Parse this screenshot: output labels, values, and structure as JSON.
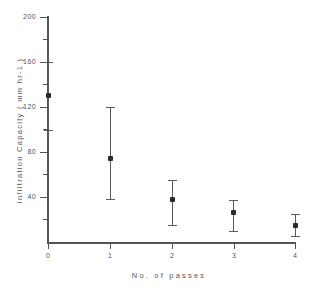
{
  "chart_data": {
    "type": "scatter",
    "title": "",
    "xlabel": "No.  of  passes",
    "ylabel": "Infiltration   Capacity   ( mm hr-1 )",
    "x": [
      0,
      1,
      2,
      3,
      4
    ],
    "categories": [
      "0",
      "1",
      "2",
      "3",
      "4"
    ],
    "values": [
      131,
      75,
      38,
      27,
      15
    ],
    "error_low": [
      100,
      38,
      15,
      10,
      5
    ],
    "error_high": [
      160,
      120,
      55,
      37,
      25
    ],
    "xlim": [
      0,
      4
    ],
    "ylim": [
      0,
      200
    ],
    "yticks": [
      0,
      40,
      80,
      120,
      160,
      200
    ],
    "ytick_labels": [
      "",
      "40",
      "80",
      "120",
      "160",
      "200"
    ],
    "yminor_ticks": [
      20,
      60,
      100,
      140,
      180
    ],
    "xticks": [
      0,
      1,
      2,
      3,
      4
    ],
    "xtick_labels": [
      "0",
      "1",
      "2",
      "3",
      "4"
    ],
    "grid": false,
    "legend": null,
    "marker": "square",
    "marker_color": "#2b2b2b",
    "errorbar_color": "#5a5a5a",
    "axis_color": "#555555",
    "background": "#ffffff",
    "series": [
      {
        "name": "Infiltration capacity",
        "points": [
          {
            "x": "0",
            "y": 131,
            "low": 100,
            "high": 160
          },
          {
            "x": "1",
            "y": 75,
            "low": 38,
            "high": 120
          },
          {
            "x": "2",
            "y": 38,
            "low": 15,
            "high": 55
          },
          {
            "x": "3",
            "y": 27,
            "low": 10,
            "high": 37
          },
          {
            "x": "4",
            "y": 15,
            "low": 5,
            "high": 25
          }
        ]
      }
    ]
  },
  "axes": {
    "y_title": "Infiltration   Capacity   ( mm hr-1 )",
    "x_title": "No.  of  passes",
    "y_tick_labels": {
      "t200": "200",
      "t160": "160",
      "t120": "120",
      "t80": "80",
      "t40": "40"
    },
    "x_tick_labels": {
      "t0": "0",
      "t1": "1",
      "t2": "2",
      "t3": "3",
      "t4": "4"
    }
  }
}
